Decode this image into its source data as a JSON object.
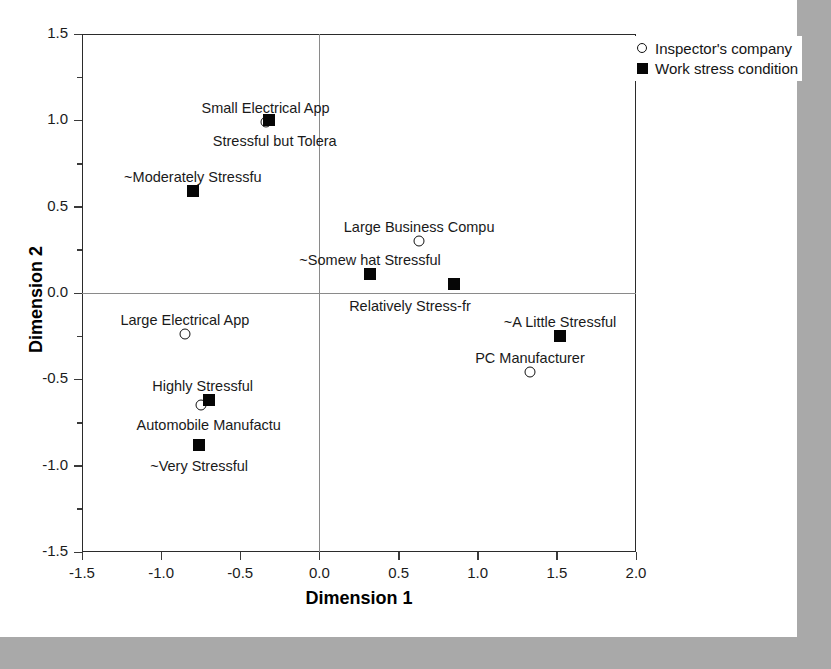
{
  "chart_data": {
    "type": "scatter",
    "title": "",
    "xlabel": "Dimension 1",
    "ylabel": "Dimension 2",
    "xlim": [
      -1.5,
      2.0
    ],
    "ylim": [
      -1.5,
      1.5
    ],
    "xticks": [
      "-1.5",
      "-1.0",
      "-0.5",
      "0.0",
      "0.5",
      "1.0",
      "1.5",
      "2.0"
    ],
    "xtick_values": [
      -1.5,
      -1.0,
      -0.5,
      0.0,
      0.5,
      1.0,
      1.5,
      2.0
    ],
    "yticks": [
      "1.5",
      "1.0",
      "0.5",
      "0.0",
      "-0.5",
      "-1.0",
      "-1.5"
    ],
    "ytick_values": [
      1.5,
      1.0,
      0.5,
      0.0,
      -0.5,
      -1.0,
      -1.5
    ],
    "grid": false,
    "legend_position": "top-right",
    "legend": [
      {
        "marker": "open-circle",
        "label": "Inspector's company"
      },
      {
        "marker": "filled-square",
        "label": "Work stress condition"
      }
    ],
    "series": [
      {
        "name": "Inspector's company",
        "marker": "open-circle",
        "points": [
          {
            "label": "Small Electrical App",
            "x": -0.34,
            "y": 0.99,
            "label_pos": "above",
            "label_dx": 0,
            "label_dy": -22
          },
          {
            "label": "Large Business Compu",
            "x": 0.63,
            "y": 0.3,
            "label_pos": "above",
            "label_dx": 0,
            "label_dy": -22
          },
          {
            "label": "Large Electrical App",
            "x": -0.85,
            "y": -0.24,
            "label_pos": "above",
            "label_dx": 0,
            "label_dy": -22
          },
          {
            "label": "Automobile Manufactu",
            "x": -0.75,
            "y": -0.65,
            "label_pos": "below",
            "label_dx": 8,
            "label_dy": 12
          },
          {
            "label": "PC Manufacturer",
            "x": 1.33,
            "y": -0.46,
            "label_pos": "above",
            "label_dx": 0,
            "label_dy": -22
          }
        ]
      },
      {
        "name": "Work stress condition",
        "marker": "filled-square",
        "points": [
          {
            "label": "Stressful but Tolera",
            "x": -0.32,
            "y": 1.0,
            "label_pos": "below",
            "label_dx": 6,
            "label_dy": 13
          },
          {
            "label": "~Moderately Stressfu",
            "x": -0.8,
            "y": 0.59,
            "label_pos": "above",
            "label_dx": 0,
            "label_dy": -22
          },
          {
            "label": "~Somew hat Stressful",
            "x": 0.32,
            "y": 0.11,
            "label_pos": "above",
            "label_dx": 0,
            "label_dy": -22
          },
          {
            "label": "Relatively Stress-fr",
            "x": 0.85,
            "y": 0.05,
            "label_pos": "below",
            "label_dx": -44,
            "label_dy": 14
          },
          {
            "label": "~A Little Stressful",
            "x": 1.52,
            "y": -0.25,
            "label_pos": "above",
            "label_dx": 0,
            "label_dy": -22
          },
          {
            "label": "Highly Stressful",
            "x": -0.7,
            "y": -0.62,
            "label_pos": "above",
            "label_dx": -6,
            "label_dy": -22
          },
          {
            "label": "~Very Stressful",
            "x": -0.76,
            "y": -0.88,
            "label_pos": "below",
            "label_dx": 0,
            "label_dy": 13
          }
        ]
      }
    ]
  }
}
